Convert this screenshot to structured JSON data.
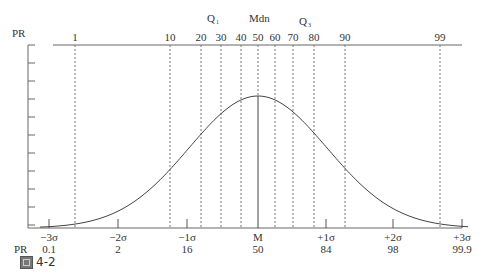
{
  "diagram": {
    "axis_label_top": "PR",
    "axis_label_bottom": "PR",
    "percentile_marks": [
      {
        "label": "1",
        "x": 75
      },
      {
        "label": "10",
        "x": 170
      },
      {
        "label": "20",
        "x": 201
      },
      {
        "label": "30",
        "x": 221
      },
      {
        "label": "40",
        "x": 241
      },
      {
        "label": "50",
        "x": 258
      },
      {
        "label": "60",
        "x": 275
      },
      {
        "label": "70",
        "x": 293
      },
      {
        "label": "80",
        "x": 314
      },
      {
        "label": "90",
        "x": 345
      },
      {
        "label": "99",
        "x": 440
      }
    ],
    "quartile_labels": {
      "q1": "Q",
      "q1_sub": "1",
      "median": "Mdn",
      "q3": "Q",
      "q3_sub": "3"
    },
    "sigma_marks": [
      {
        "label": "−3σ",
        "pr": "0.1",
        "x": 49
      },
      {
        "label": "−2σ",
        "pr": "2",
        "x": 118
      },
      {
        "label": "−1σ",
        "pr": "16",
        "x": 187
      },
      {
        "label": "M",
        "pr": "50",
        "x": 258
      },
      {
        "label": "+1σ",
        "pr": "84",
        "x": 326
      },
      {
        "label": "+2σ",
        "pr": "98",
        "x": 393
      },
      {
        "label": "+3σ",
        "pr": "99.9",
        "x": 462
      }
    ]
  },
  "caption": {
    "icon": "figure-icon",
    "text": "4-2"
  }
}
